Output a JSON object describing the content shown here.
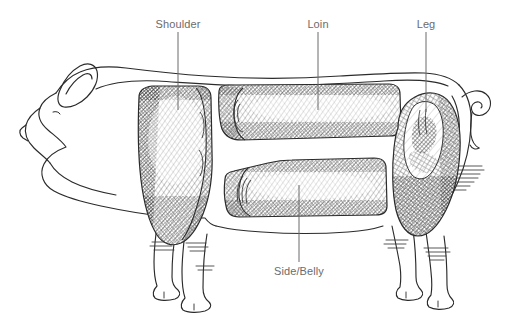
{
  "diagram": {
    "style": "pen-and-ink line drawing with cross-hatched cuts",
    "background_color": "#ffffff",
    "line_color": "#2b2b2b",
    "label_color": "#6b6b6b",
    "hatch_color": "#3a3a3a",
    "width": 510,
    "height": 323
  },
  "labels": [
    {
      "id": "shoulder",
      "text": "Shoulder",
      "x": 178,
      "y": 18,
      "leader": {
        "x": 178,
        "y1": 32,
        "y2": 110
      }
    },
    {
      "id": "loin",
      "text": "Loin",
      "x": 318,
      "y": 18,
      "leader": {
        "x": 318,
        "y1": 32,
        "y2": 110
      }
    },
    {
      "id": "leg",
      "text": "Leg",
      "x": 426,
      "y": 18,
      "leader": {
        "x": 426,
        "y1": 32,
        "y2": 112
      }
    },
    {
      "id": "side-belly",
      "text": "Side/Belly",
      "x": 299,
      "y": 265,
      "leader": {
        "x": 299,
        "y1": 185,
        "y2": 262
      }
    }
  ],
  "cuts": [
    {
      "id": "shoulder",
      "name": "Shoulder",
      "shading": "dense cross-hatch, dark edges"
    },
    {
      "id": "loin",
      "name": "Loin",
      "shading": "diagonal hatch with cut face at left end"
    },
    {
      "id": "side-belly",
      "name": "Side/Belly",
      "shading": "diagonal hatch with rolled cut face at left end"
    },
    {
      "id": "leg",
      "name": "Leg",
      "shading": "cross-hatch with lighter highlight patch"
    }
  ],
  "anatomy": [
    {
      "id": "head",
      "name": "head"
    },
    {
      "id": "ear",
      "name": "ear"
    },
    {
      "id": "snout",
      "name": "snout"
    },
    {
      "id": "eye",
      "name": "eye"
    },
    {
      "id": "tail",
      "name": "curly tail"
    },
    {
      "id": "front-legs",
      "name": "front legs"
    },
    {
      "id": "hind-legs",
      "name": "hind legs"
    },
    {
      "id": "back-line",
      "name": "back line"
    },
    {
      "id": "belly-line",
      "name": "belly line"
    }
  ]
}
